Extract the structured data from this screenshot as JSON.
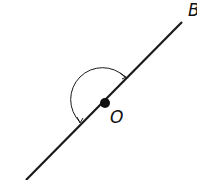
{
  "diagram": {
    "type": "straight-angle",
    "labels": {
      "end_point": "B",
      "vertex": "O"
    },
    "colors": {
      "line": "#1a1a1a",
      "background": "#ffffff"
    }
  }
}
